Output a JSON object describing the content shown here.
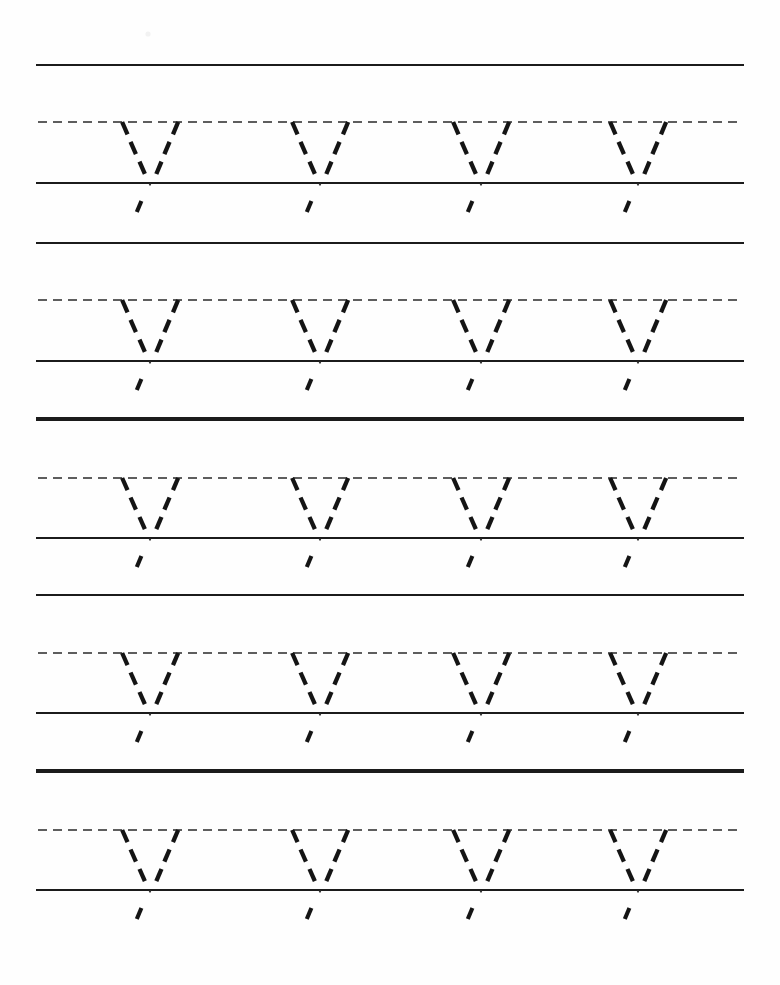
{
  "worksheet": {
    "title": "Letter V Tracing Practice Worksheet",
    "letter": "V",
    "letter_case": "uppercase",
    "rows_count": 5,
    "letters_per_row": 4,
    "page_width": 780,
    "page_height": 985,
    "ink_color": "#141414",
    "rule_color": "#1b1b1b",
    "dashed_rule_color": "#2a2a2a",
    "background_color": "#fefefe"
  },
  "geometry": {
    "rule_left": 36,
    "rule_right": 744,
    "dash_rule_left": 38,
    "dash_rule_right": 742,
    "letter_apex_x": [
      150,
      320,
      481,
      638
    ],
    "letter_top_half_width": 28,
    "row_pitch": 177
  },
  "rows": [
    {
      "index": 1,
      "name": "practice-row-1",
      "top_line_y": 65,
      "dashed_line_y": 122,
      "baseline_y": 183,
      "bottom_line_y": 243,
      "has_bottom_line": true,
      "letters": [
        {
          "name": "trace-letter-v",
          "glyph": "V",
          "apex_x": 150
        },
        {
          "name": "trace-letter-v",
          "glyph": "V",
          "apex_x": 320
        },
        {
          "name": "trace-letter-v",
          "glyph": "V",
          "apex_x": 481
        },
        {
          "name": "trace-letter-v",
          "glyph": "V",
          "apex_x": 638
        }
      ]
    },
    {
      "index": 2,
      "name": "practice-row-2",
      "top_line_y": 243,
      "dashed_line_y": 300,
      "baseline_y": 361,
      "bottom_line_y": 418,
      "has_bottom_line": true,
      "letters": [
        {
          "name": "trace-letter-v",
          "glyph": "V",
          "apex_x": 150
        },
        {
          "name": "trace-letter-v",
          "glyph": "V",
          "apex_x": 320
        },
        {
          "name": "trace-letter-v",
          "glyph": "V",
          "apex_x": 481
        },
        {
          "name": "trace-letter-v",
          "glyph": "V",
          "apex_x": 638
        }
      ]
    },
    {
      "index": 3,
      "name": "practice-row-3",
      "top_line_y": 420,
      "dashed_line_y": 478,
      "baseline_y": 538,
      "bottom_line_y": 595,
      "has_bottom_line": true,
      "letters": [
        {
          "name": "trace-letter-v",
          "glyph": "V",
          "apex_x": 150
        },
        {
          "name": "trace-letter-v",
          "glyph": "V",
          "apex_x": 320
        },
        {
          "name": "trace-letter-v",
          "glyph": "V",
          "apex_x": 481
        },
        {
          "name": "trace-letter-v",
          "glyph": "V",
          "apex_x": 638
        }
      ]
    },
    {
      "index": 4,
      "name": "practice-row-4",
      "top_line_y": 595,
      "dashed_line_y": 653,
      "baseline_y": 713,
      "bottom_line_y": 770,
      "has_bottom_line": true,
      "letters": [
        {
          "name": "trace-letter-v",
          "glyph": "V",
          "apex_x": 150
        },
        {
          "name": "trace-letter-v",
          "glyph": "V",
          "apex_x": 320
        },
        {
          "name": "trace-letter-v",
          "glyph": "V",
          "apex_x": 481
        },
        {
          "name": "trace-letter-v",
          "glyph": "V",
          "apex_x": 638
        }
      ]
    },
    {
      "index": 5,
      "name": "practice-row-5",
      "top_line_y": 772,
      "dashed_line_y": 830,
      "baseline_y": 890,
      "bottom_line_y": null,
      "has_bottom_line": false,
      "letters": [
        {
          "name": "trace-letter-v",
          "glyph": "V",
          "apex_x": 150
        },
        {
          "name": "trace-letter-v",
          "glyph": "V",
          "apex_x": 320
        },
        {
          "name": "trace-letter-v",
          "glyph": "V",
          "apex_x": 481
        },
        {
          "name": "trace-letter-v",
          "glyph": "V",
          "apex_x": 638
        }
      ]
    }
  ],
  "artifacts": [
    {
      "name": "scan-speck",
      "x": 148,
      "y": 34,
      "r": 2.6
    }
  ]
}
